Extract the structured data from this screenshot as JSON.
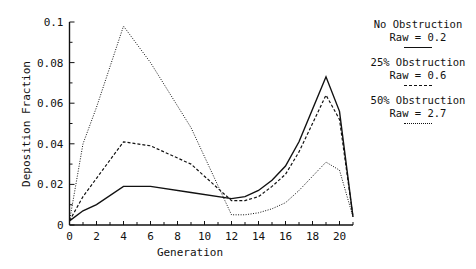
{
  "chart_data": {
    "type": "line",
    "title": "",
    "xlabel": "Generation",
    "ylabel": "Deposition Fraction",
    "xlim": [
      0,
      21
    ],
    "ylim": [
      0,
      0.1
    ],
    "x_ticks": [
      "0",
      "2",
      "4",
      "6",
      "8",
      "10",
      "12",
      "14",
      "16",
      "18",
      "20"
    ],
    "y_ticks": [
      "0",
      "0.02",
      "0.04",
      "0.06",
      "0.08",
      "0.1"
    ],
    "grid": false,
    "legend_position": "right",
    "x": [
      0,
      1,
      2,
      4,
      6,
      9,
      12,
      13,
      14,
      15,
      16,
      17,
      18,
      19,
      20,
      21
    ],
    "series": [
      {
        "name": "No Obstruction",
        "subtitle": "Raw = 0.2",
        "style": "solid",
        "values": [
          0.002,
          0.007,
          0.01,
          0.019,
          0.019,
          0.016,
          0.013,
          0.014,
          0.017,
          0.022,
          0.029,
          0.041,
          0.057,
          0.073,
          0.056,
          0.004
        ]
      },
      {
        "name": "25% Obstruction",
        "subtitle": "Raw = 0.6",
        "style": "dashed",
        "values": [
          0.002,
          0.014,
          0.023,
          0.041,
          0.039,
          0.03,
          0.012,
          0.012,
          0.014,
          0.019,
          0.025,
          0.036,
          0.05,
          0.064,
          0.052,
          0.004
        ]
      },
      {
        "name": "50% Obstruction",
        "subtitle": "Raw = 2.7",
        "style": "dotted",
        "values": [
          0.002,
          0.04,
          0.058,
          0.098,
          0.08,
          0.048,
          0.005,
          0.005,
          0.006,
          0.008,
          0.011,
          0.017,
          0.024,
          0.031,
          0.027,
          0.004
        ]
      }
    ]
  },
  "legend": [
    {
      "title": "No Obstruction",
      "sub": "Raw = 0.2"
    },
    {
      "title": "25% Obstruction",
      "sub": "Raw = 0.6"
    },
    {
      "title": "50% Obstruction",
      "sub": "Raw = 2.7"
    }
  ],
  "axes": {
    "xlabel": "Generation",
    "ylabel": "Deposition Fraction"
  }
}
